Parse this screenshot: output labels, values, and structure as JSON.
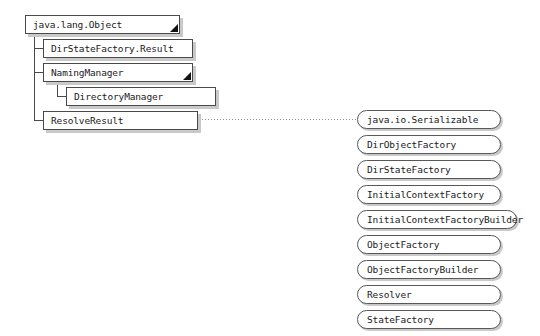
{
  "diagram": {
    "root_class": "java.lang.Object",
    "classes": [
      {
        "label": "java.lang.Object",
        "level": 0,
        "x": 25,
        "y": 15,
        "w": 155,
        "has_subclasses": true
      },
      {
        "label": "DirStateFactory.Result",
        "level": 1,
        "x": 43,
        "y": 39,
        "w": 150,
        "has_subclasses": false
      },
      {
        "label": "NamingManager",
        "level": 1,
        "x": 43,
        "y": 63,
        "w": 150,
        "has_subclasses": true
      },
      {
        "label": "DirectoryManager",
        "level": 2,
        "x": 66,
        "y": 87,
        "w": 150,
        "has_subclasses": false
      },
      {
        "label": "ResolveResult",
        "level": 1,
        "x": 43,
        "y": 111,
        "w": 155,
        "has_subclasses": false
      }
    ],
    "interfaces": [
      {
        "label": "java.io.Serializable",
        "x": 357,
        "y": 110,
        "w": 144
      },
      {
        "label": "DirObjectFactory",
        "x": 357,
        "y": 135,
        "w": 144
      },
      {
        "label": "DirStateFactory",
        "x": 357,
        "y": 160,
        "w": 144
      },
      {
        "label": "InitialContextFactory",
        "x": 357,
        "y": 185,
        "w": 144
      },
      {
        "label": "InitialContextFactoryBuilder",
        "x": 357,
        "y": 210,
        "w": 160
      },
      {
        "label": "ObjectFactory",
        "x": 357,
        "y": 235,
        "w": 144
      },
      {
        "label": "ObjectFactoryBuilder",
        "x": 357,
        "y": 260,
        "w": 144
      },
      {
        "label": "Resolver",
        "x": 357,
        "y": 285,
        "w": 144
      },
      {
        "label": "StateFactory",
        "x": 357,
        "y": 310,
        "w": 144
      }
    ],
    "implements_link": {
      "from": "ResolveResult",
      "to": "java.io.Serializable",
      "x": 202,
      "y": 119,
      "length": 155,
      "style": "dotted"
    },
    "connectors": {
      "trunk_from_root": {
        "x": 34,
        "y": 34,
        "height": 87
      },
      "trunk_from_naming": {
        "x": 57,
        "y": 82,
        "height": 15
      },
      "elbows": [
        {
          "x": 34,
          "y": 48,
          "width": 9
        },
        {
          "x": 34,
          "y": 72,
          "width": 9
        },
        {
          "x": 57,
          "y": 96,
          "width": 9
        },
        {
          "x": 34,
          "y": 120,
          "width": 9
        }
      ]
    },
    "colors": {
      "box_border": "#4a4a4a",
      "pill_border": "#585858",
      "shadow": "#c9c9c9",
      "text": "#1a1a1a",
      "connector": "#4a4a4a",
      "dotted": "#8d8d8d",
      "background": "#ffffff",
      "marker": "#111111"
    }
  }
}
